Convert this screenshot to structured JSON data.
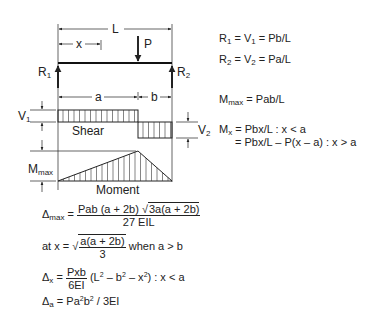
{
  "diagram": {
    "labels": {
      "span": "L",
      "x": "x",
      "load": "P",
      "r1": "R",
      "r1_sub": "1",
      "r2": "R",
      "r2_sub": "2",
      "a": "a",
      "b": "b",
      "v1": "V",
      "v1_sub": "1",
      "v2": "V",
      "v2_sub": "2",
      "mmax": "M",
      "mmax_sub": "max",
      "shear": "Shear",
      "moment": "Moment"
    },
    "geometry_data": {
      "a_over_L": 0.7,
      "b_over_L": 0.3
    }
  },
  "formulas": {
    "r1": {
      "lhs": "R",
      "lhs_sub": "1",
      "mid": " = V",
      "mid_sub": "1",
      "rhs": " = Pb/L"
    },
    "r2": {
      "lhs": "R",
      "lhs_sub": "2",
      "mid": " = V",
      "mid_sub": "2",
      "rhs": " = Pa/L"
    },
    "mmax": {
      "lhs": "M",
      "lhs_sub": "max",
      "rhs": " = Pab/L"
    },
    "mx1": {
      "lhs": "M",
      "lhs_sub": "x",
      "rhs": " = Pbx/L : x < a"
    },
    "mx2": {
      "rhs": "= Pbx/L – P(x – a) : x > a"
    },
    "dmax": {
      "lhs": "Δ",
      "lhs_sub": "max",
      "eq": " = ",
      "num_a": "Pab (a + 2b) √",
      "num_sqrt": "3a(a + 2b)",
      "den": "27 EIL"
    },
    "atx": {
      "lhs": "at x = √",
      "num": "a(a + 2b)",
      "den": "3",
      "tail": " when a > b"
    },
    "dx": {
      "lhs": "Δ",
      "lhs_sub": "x",
      "eq": " = ",
      "num": "Pxb",
      "den": "6EI",
      "tail_a": " (L",
      "tail_b": " – b",
      "tail_c": " – x",
      "tail_d": ") : x < a",
      "sq": "2"
    },
    "da": {
      "lhs": "Δ",
      "lhs_sub": "a",
      "eq": " = Pa",
      "sq": "2",
      "mid": "b",
      "rest": " / 3EI"
    }
  }
}
